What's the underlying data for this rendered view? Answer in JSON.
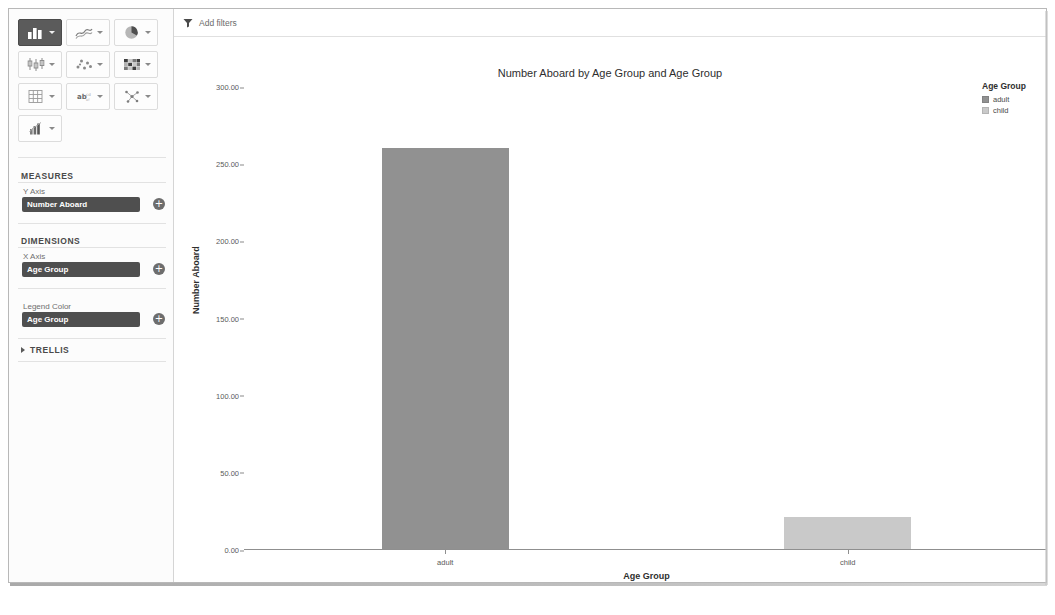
{
  "viz_toolbar": {
    "buttons": [
      {
        "name": "bar-chart",
        "selected": true
      },
      {
        "name": "line-chart",
        "selected": false
      },
      {
        "name": "pie-chart",
        "selected": false
      },
      {
        "name": "box-plot-chart",
        "selected": false
      },
      {
        "name": "scatter-plot-chart",
        "selected": false
      },
      {
        "name": "heatmap-chart",
        "selected": false
      },
      {
        "name": "table-grid-chart",
        "selected": false
      },
      {
        "name": "word-cloud-chart",
        "selected": false
      },
      {
        "name": "network-chart",
        "selected": false
      },
      {
        "name": "combo-statistics-chart",
        "selected": false
      }
    ]
  },
  "sidebar": {
    "measures_title": "MEASURES",
    "y_axis_label": "Y Axis",
    "y_axis_field": "Number Aboard",
    "dimensions_title": "DIMENSIONS",
    "x_axis_label": "X Axis",
    "x_axis_field": "Age Group",
    "legend_color_label": "Legend Color",
    "legend_color_field": "Age Group",
    "trellis_title": "TRELLIS",
    "add_symbol": "+"
  },
  "filter_bar": {
    "label": "Add filters"
  },
  "chart_data": {
    "type": "bar",
    "title": "Number Aboard by Age Group and Age Group",
    "categories": [
      "adult",
      "child"
    ],
    "values": [
      260,
      21
    ],
    "series": [
      {
        "name": "adult",
        "values": [
          260,
          null
        ],
        "color": "#919191"
      },
      {
        "name": "child",
        "values": [
          null,
          21
        ],
        "color": "#c9c9c9"
      }
    ],
    "xlabel": "Age Group",
    "ylabel": "Number Aboard",
    "ylim": [
      0,
      300
    ],
    "yticks": [
      "0.00",
      "50.00",
      "100.00",
      "150.00",
      "200.00",
      "250.00",
      "300.00"
    ],
    "ytick_values": [
      0,
      50,
      100,
      150,
      200,
      250,
      300
    ],
    "grid": false,
    "legend": {
      "title": "Age Group",
      "position": "right",
      "entries": [
        {
          "label": "adult",
          "color": "#919191"
        },
        {
          "label": "child",
          "color": "#c9c9c9"
        }
      ]
    }
  }
}
